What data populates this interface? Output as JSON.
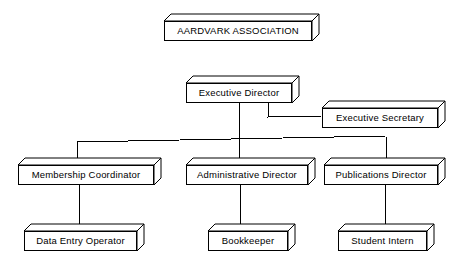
{
  "chart": {
    "type": "organization-chart",
    "title": "AARDVARK ASSOCIATION",
    "style": {
      "box_fill": "#ffffff",
      "box_stroke": "#000000",
      "connector_stroke": "#000000",
      "background": "#ffffff",
      "depth_px": 7
    },
    "nodes": [
      {
        "id": "aardvark-association",
        "label": "AARDVARK ASSOCIATION",
        "level": 0,
        "x": 164,
        "y": 14,
        "w": 148,
        "h": 20,
        "font_size": 9.5
      },
      {
        "id": "executive-director",
        "label": "Executive Director",
        "level": 1,
        "x": 186,
        "y": 76,
        "w": 106,
        "h": 20,
        "font_size": 9.5
      },
      {
        "id": "executive-secretary",
        "label": "Executive Secretary",
        "level": 2,
        "x": 322,
        "y": 101,
        "w": 116,
        "h": 20,
        "font_size": 9.5
      },
      {
        "id": "membership-coordinator",
        "label": "Membership Coordinator",
        "level": 2,
        "x": 18,
        "y": 158,
        "w": 136,
        "h": 20,
        "font_size": 9.5
      },
      {
        "id": "administrative-director",
        "label": "Administrative Director",
        "level": 2,
        "x": 186,
        "y": 158,
        "w": 122,
        "h": 20,
        "font_size": 9.5
      },
      {
        "id": "publications-director",
        "label": "Publications Director",
        "level": 2,
        "x": 324,
        "y": 158,
        "w": 114,
        "h": 20,
        "font_size": 9.5
      },
      {
        "id": "data-entry-operator",
        "label": "Data Entry Operator",
        "level": 3,
        "x": 24,
        "y": 224,
        "w": 113,
        "h": 20,
        "font_size": 9.5
      },
      {
        "id": "bookkeeper",
        "label": "Bookkeeper",
        "level": 3,
        "x": 208,
        "y": 224,
        "w": 80,
        "h": 20,
        "font_size": 9.5
      },
      {
        "id": "student-intern",
        "label": "Student Intern",
        "level": 3,
        "x": 338,
        "y": 224,
        "w": 89,
        "h": 20,
        "font_size": 9.5
      }
    ],
    "connectors": [
      {
        "id": "director-to-secretary",
        "from": "executive-director",
        "to": "executive-secretary",
        "path": "M 268 96 L 268 117 L 322 116"
      },
      {
        "id": "director-trunk",
        "from": "executive-director",
        "to": "bus",
        "path": "M 239 96 L 239 158"
      },
      {
        "id": "bus-line",
        "from": "director-trunk",
        "to": "siblings",
        "path": "M 77 142 L 386 136"
      },
      {
        "id": "bus-to-membership",
        "from": "bus",
        "to": "membership-coordinator",
        "path": "M 77 141 L 77 158"
      },
      {
        "id": "bus-to-publications",
        "from": "bus",
        "to": "publications-director",
        "path": "M 386 137 L 386 158"
      },
      {
        "id": "membership-to-data-entry",
        "from": "membership-coordinator",
        "to": "data-entry-operator",
        "path": "M 79 178 L 79 224"
      },
      {
        "id": "administrative-to-bookkeeper",
        "from": "administrative-director",
        "to": "bookkeeper",
        "path": "M 240 178 L 240 224"
      },
      {
        "id": "publications-to-intern",
        "from": "publications-director",
        "to": "student-intern",
        "path": "M 385 178 L 385 224"
      }
    ]
  }
}
